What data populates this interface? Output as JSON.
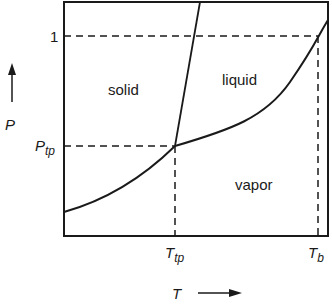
{
  "diagram": {
    "title": "",
    "type": "phase-diagram",
    "axes": {
      "y_label": "P",
      "x_label": "T",
      "y_ticks": [
        {
          "main": "1",
          "sub": ""
        },
        {
          "main": "P",
          "sub": "tp"
        }
      ],
      "x_ticks": [
        {
          "main": "T",
          "sub": "tp"
        },
        {
          "main": "T",
          "sub": "b"
        }
      ]
    },
    "regions": {
      "solid": "solid",
      "liquid": "liquid",
      "vapor": "vapor"
    },
    "curves": [
      {
        "name": "sublimation-curve",
        "from": "left edge",
        "to": "triple point"
      },
      {
        "name": "melting-line",
        "from": "triple point",
        "to": "top edge"
      },
      {
        "name": "vaporization-curve",
        "from": "triple point",
        "to": "right edge (through T_b at P=1)"
      }
    ],
    "guides": [
      {
        "name": "P=1 dashed",
        "orientation": "horizontal"
      },
      {
        "name": "P_tp dashed",
        "orientation": "horizontal"
      },
      {
        "name": "T_tp dashed",
        "orientation": "vertical"
      },
      {
        "name": "T_b dashed",
        "orientation": "vertical"
      }
    ],
    "colors": {
      "line": "#1a1a1a",
      "background": "#ffffff"
    }
  }
}
